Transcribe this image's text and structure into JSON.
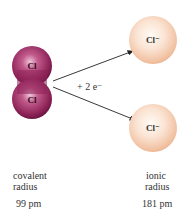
{
  "molecule": {
    "atoms": [
      {
        "symbol": "Cl"
      },
      {
        "symbol": "Cl"
      }
    ],
    "color": "#9b2d66"
  },
  "reaction": {
    "label": "+ 2 e⁻"
  },
  "ions": [
    {
      "symbol": "Cl⁻"
    },
    {
      "symbol": "Cl⁻"
    }
  ],
  "ion_color": "#f3c9ad",
  "captions": {
    "covalent": {
      "line1": "covalent",
      "line2": "radius",
      "value": "99 pm"
    },
    "ionic": {
      "line1": "ionic",
      "line2": "radius",
      "value": "181 pm"
    }
  }
}
